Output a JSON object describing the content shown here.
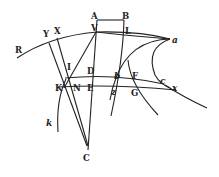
{
  "diagram": {
    "type": "geometric-figure",
    "background": "#ffffff",
    "ink": "#222222",
    "labels": {
      "A": "A",
      "B": "B",
      "V": "V",
      "L": "L",
      "R": "R",
      "Y": "Y",
      "X": "X",
      "a": "a",
      "I": "I",
      "D": "D",
      "b": "b",
      "F": "F",
      "c": "c",
      "x": "x",
      "K": "K",
      "N": "N",
      "E": "E",
      "z": "z",
      "G": "G",
      "k": "k",
      "C": "C"
    }
  }
}
